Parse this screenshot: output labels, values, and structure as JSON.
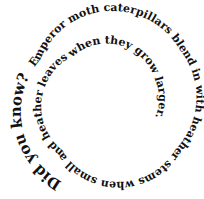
{
  "spiral": {
    "heading": "Did you know?",
    "body": "Emperor moth caterpillars blend in with heather stems when small and heather leaves when they grow larger.",
    "text_color": "#111111",
    "background": "#ffffff"
  }
}
